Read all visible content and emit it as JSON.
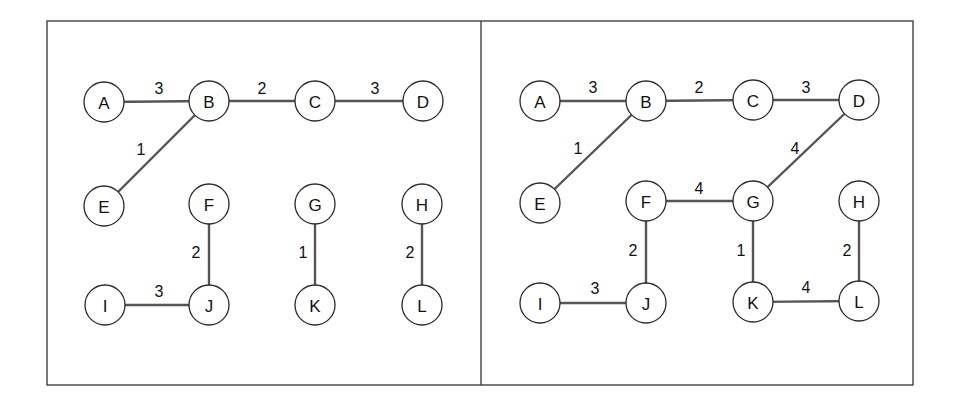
{
  "figure": {
    "frame": {
      "x": 47,
      "y": 21,
      "width": 866,
      "height": 364,
      "divider_x": 481
    },
    "node_radius": 20,
    "panels": [
      {
        "id": "left",
        "nodes": [
          {
            "id": "A",
            "label": "A",
            "x": 104,
            "y": 102
          },
          {
            "id": "B",
            "label": "B",
            "x": 209,
            "y": 101
          },
          {
            "id": "C",
            "label": "C",
            "x": 315,
            "y": 101
          },
          {
            "id": "D",
            "label": "D",
            "x": 423,
            "y": 101
          },
          {
            "id": "E",
            "label": "E",
            "x": 104,
            "y": 206
          },
          {
            "id": "F",
            "label": "F",
            "x": 209,
            "y": 204
          },
          {
            "id": "G",
            "label": "G",
            "x": 315,
            "y": 204
          },
          {
            "id": "H",
            "label": "H",
            "x": 422,
            "y": 204
          },
          {
            "id": "I",
            "label": "I",
            "x": 105,
            "y": 305
          },
          {
            "id": "J",
            "label": "J",
            "x": 209,
            "y": 305
          },
          {
            "id": "K",
            "label": "K",
            "x": 315,
            "y": 305
          },
          {
            "id": "L",
            "label": "L",
            "x": 422,
            "y": 305
          }
        ],
        "edges": [
          {
            "from": "A",
            "to": "B",
            "weight": "3",
            "lx": 159,
            "ly": 88
          },
          {
            "from": "B",
            "to": "C",
            "weight": "2",
            "lx": 262,
            "ly": 88
          },
          {
            "from": "C",
            "to": "D",
            "weight": "3",
            "lx": 375,
            "ly": 88
          },
          {
            "from": "B",
            "to": "E",
            "weight": "1",
            "lx": 141,
            "ly": 149
          },
          {
            "from": "F",
            "to": "J",
            "weight": "2",
            "lx": 196,
            "ly": 252
          },
          {
            "from": "G",
            "to": "K",
            "weight": "1",
            "lx": 303,
            "ly": 252
          },
          {
            "from": "H",
            "to": "L",
            "weight": "2",
            "lx": 410,
            "ly": 252
          },
          {
            "from": "I",
            "to": "J",
            "weight": "3",
            "lx": 159,
            "ly": 291
          }
        ]
      },
      {
        "id": "right",
        "nodes": [
          {
            "id": "A",
            "label": "A",
            "x": 540,
            "y": 101
          },
          {
            "id": "B",
            "label": "B",
            "x": 646,
            "y": 101
          },
          {
            "id": "C",
            "label": "C",
            "x": 753,
            "y": 100
          },
          {
            "id": "D",
            "label": "D",
            "x": 859,
            "y": 100
          },
          {
            "id": "E",
            "label": "E",
            "x": 540,
            "y": 203
          },
          {
            "id": "F",
            "label": "F",
            "x": 646,
            "y": 201
          },
          {
            "id": "G",
            "label": "G",
            "x": 753,
            "y": 201
          },
          {
            "id": "H",
            "label": "H",
            "x": 859,
            "y": 201
          },
          {
            "id": "I",
            "label": "I",
            "x": 540,
            "y": 303
          },
          {
            "id": "J",
            "label": "J",
            "x": 646,
            "y": 303
          },
          {
            "id": "K",
            "label": "K",
            "x": 753,
            "y": 302
          },
          {
            "id": "L",
            "label": "L",
            "x": 859,
            "y": 301
          }
        ],
        "edges": [
          {
            "from": "A",
            "to": "B",
            "weight": "3",
            "lx": 593,
            "ly": 87
          },
          {
            "from": "B",
            "to": "C",
            "weight": "2",
            "lx": 699,
            "ly": 87
          },
          {
            "from": "C",
            "to": "D",
            "weight": "3",
            "lx": 806,
            "ly": 87
          },
          {
            "from": "B",
            "to": "E",
            "weight": "1",
            "lx": 578,
            "ly": 148
          },
          {
            "from": "D",
            "to": "G",
            "weight": "4",
            "lx": 795,
            "ly": 148
          },
          {
            "from": "F",
            "to": "G",
            "weight": "4",
            "lx": 699,
            "ly": 188
          },
          {
            "from": "F",
            "to": "J",
            "weight": "2",
            "lx": 633,
            "ly": 250
          },
          {
            "from": "G",
            "to": "K",
            "weight": "1",
            "lx": 741,
            "ly": 250
          },
          {
            "from": "H",
            "to": "L",
            "weight": "2",
            "lx": 847,
            "ly": 250
          },
          {
            "from": "I",
            "to": "J",
            "weight": "3",
            "lx": 595,
            "ly": 288
          },
          {
            "from": "K",
            "to": "L",
            "weight": "4",
            "lx": 806,
            "ly": 287
          }
        ]
      }
    ]
  }
}
